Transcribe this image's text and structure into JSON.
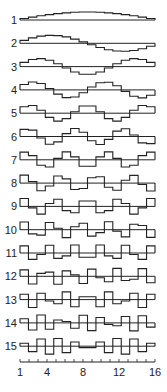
{
  "figure": {
    "type": "basis-function-stack",
    "rows": [
      {
        "order": 1,
        "label": "1"
      },
      {
        "order": 2,
        "label": "2"
      },
      {
        "order": 3,
        "label": "3"
      },
      {
        "order": 4,
        "label": "4"
      },
      {
        "order": 5,
        "label": "5"
      },
      {
        "order": 6,
        "label": "6"
      },
      {
        "order": 7,
        "label": "7"
      },
      {
        "order": 8,
        "label": "8"
      },
      {
        "order": 9,
        "label": "9"
      },
      {
        "order": 10,
        "label": "10"
      },
      {
        "order": 11,
        "label": "11"
      },
      {
        "order": 12,
        "label": "12"
      },
      {
        "order": 13,
        "label": "13"
      },
      {
        "order": 14,
        "label": "14"
      },
      {
        "order": 15,
        "label": "15"
      }
    ],
    "x_axis": {
      "min": 1,
      "max": 16,
      "tick_count": 16,
      "tick_labels": [
        "1",
        "4",
        "8",
        "12",
        "16"
      ],
      "tick_label_positions": [
        1,
        4,
        8,
        12,
        16
      ]
    },
    "line_color": "#222222",
    "background": "#ffffff"
  }
}
